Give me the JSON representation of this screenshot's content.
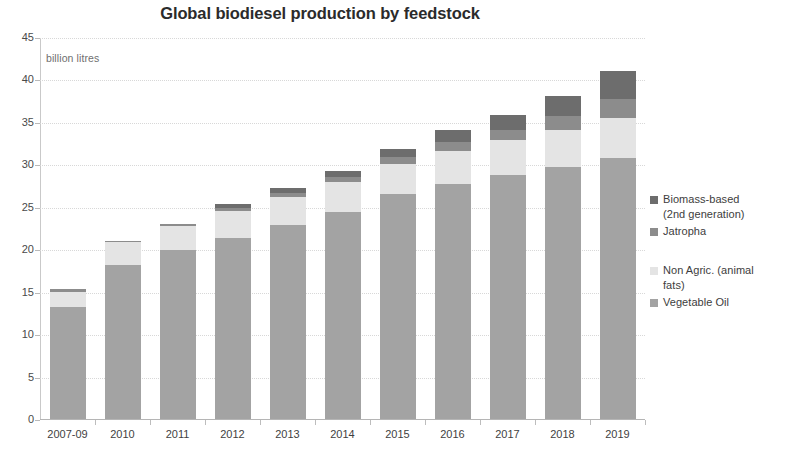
{
  "chart_data": {
    "type": "bar",
    "subtype": "stacked-bar",
    "title": "Global biodiesel production by feedstock",
    "xlabel": "",
    "ylabel": "billion litres",
    "unit_note": "billion litres",
    "ylim": [
      0,
      45
    ],
    "ytick_step": 5,
    "yticks": [
      "0",
      "5",
      "10",
      "15",
      "20",
      "25",
      "30",
      "35",
      "40",
      "45"
    ],
    "grid": true,
    "grid_style": "dotted horizontal",
    "legend_position": "right",
    "categories": [
      "2007-09",
      "2010",
      "2011",
      "2012",
      "2013",
      "2014",
      "2015",
      "2016",
      "2017",
      "2018",
      "2019"
    ],
    "series": [
      {
        "name": "Vegetable Oil",
        "color": "#a3a3a3",
        "values": [
          13.2,
          18.2,
          19.9,
          21.3,
          22.8,
          24.4,
          26.5,
          27.7,
          28.8,
          29.7,
          30.7
        ]
      },
      {
        "name": "Non Agric. (animal fats)",
        "color": "#e4e4e4",
        "values": [
          1.8,
          2.6,
          2.8,
          3.2,
          3.3,
          3.5,
          3.6,
          3.9,
          4.1,
          4.4,
          4.8
        ]
      },
      {
        "name": "Jatropha",
        "color": "#8c8c8c",
        "values": [
          0.3,
          0.2,
          0.3,
          0.4,
          0.5,
          0.6,
          0.8,
          1.0,
          1.2,
          1.6,
          2.2
        ]
      },
      {
        "name": "Biomass-based (2nd generation)",
        "color": "#6d6d6d",
        "values": [
          0.0,
          0.0,
          0.0,
          0.4,
          0.6,
          0.7,
          0.9,
          1.4,
          1.7,
          2.3,
          3.3
        ]
      }
    ],
    "totals": [
      15.3,
      21.0,
      23.0,
      25.3,
      27.2,
      29.2,
      31.8,
      34.0,
      35.8,
      38.0,
      41.0
    ]
  },
  "legend": {
    "items": [
      {
        "label": "Biomass-based",
        "label_line2": "(2nd generation)",
        "color": "#6d6d6d"
      },
      {
        "label": "Jatropha",
        "label_line2": "",
        "color": "#8c8c8c"
      },
      {
        "label": "Non Agric. (animal",
        "label_line2": "fats)",
        "color": "#e4e4e4"
      },
      {
        "label": "Vegetable Oil",
        "label_line2": "",
        "color": "#a3a3a3"
      }
    ]
  },
  "colors": {
    "background": "#ffffff",
    "title": "#2b2b2b",
    "gridline": "#d8d8d8",
    "axis": "#b9b9b9",
    "tick_text": "#4a4a4a"
  }
}
